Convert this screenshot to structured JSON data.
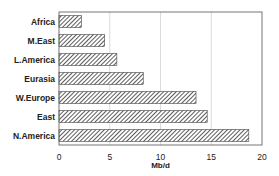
{
  "chart_data": {
    "type": "bar",
    "orientation": "horizontal",
    "title": "",
    "xlabel": "Mb/d",
    "ylabel": "",
    "categories": [
      "Africa",
      "M.East",
      "L.America",
      "Eurasia",
      "W.Europe",
      "East",
      "N.America"
    ],
    "values": [
      2.2,
      4.5,
      5.7,
      8.3,
      13.5,
      14.6,
      18.7
    ],
    "xlim": [
      0,
      20
    ],
    "xticks": [
      0,
      5,
      10,
      15,
      20
    ],
    "xtick_labels": [
      "0",
      "5",
      "10",
      "15",
      "20"
    ],
    "grid": "vertical",
    "legend": "none",
    "bar_fill": "diagonal-hatch",
    "colors": {
      "hatch": "#333333",
      "bar_outline": "#444444",
      "grid": "#d0d0d0",
      "frame": "#666666",
      "background": "#ffffff"
    }
  }
}
